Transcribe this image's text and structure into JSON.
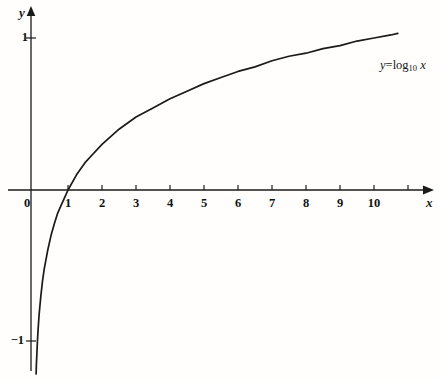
{
  "figure": {
    "background_color": "#fffefd",
    "ink_color": "#1a1a1a"
  },
  "axes": {
    "x_var_label": "x",
    "y_var_label": "y",
    "origin_label": "0"
  },
  "annotation": {
    "equation_y": "y",
    "equation_equals": "=",
    "equation_fn": "log",
    "equation_base": "10",
    "equation_arg": "x",
    "equation_plain": "y=log10 x"
  },
  "chart_data": {
    "type": "line",
    "title": "",
    "subtitle": "",
    "xlabel": "x",
    "ylabel": "y",
    "xlim": [
      -0.35,
      10.9
    ],
    "ylim": [
      -1.22,
      1.16
    ],
    "grid": false,
    "legend_position": "none",
    "annotations": [
      {
        "text": "y=log10 x",
        "x": 10.3,
        "y": 0.85
      }
    ],
    "xticks": [
      0,
      1,
      2,
      3,
      4,
      5,
      6,
      7,
      8,
      9,
      10
    ],
    "xtick_labels": [
      "0",
      "1",
      "2",
      "3",
      "4",
      "5",
      "6",
      "7",
      "8",
      "9",
      "10"
    ],
    "yticks": [
      -1,
      1
    ],
    "ytick_labels": [
      "-1",
      "1"
    ],
    "series": [
      {
        "name": "y=log10 x",
        "color": "#1a1a1a",
        "x": [
          0.062,
          0.07,
          0.08,
          0.09,
          0.1,
          0.12,
          0.15,
          0.2,
          0.25,
          0.3,
          0.4,
          0.5,
          0.6,
          0.7,
          0.8,
          0.9,
          1.0,
          1.25,
          1.5,
          1.75,
          2.0,
          2.5,
          3.0,
          3.5,
          4.0,
          4.5,
          5.0,
          5.5,
          6.0,
          6.5,
          7.0,
          7.5,
          8.0,
          8.5,
          9.0,
          9.5,
          10.0,
          10.5,
          10.7
        ],
        "y": [
          -1.21,
          -1.15,
          -1.1,
          -1.05,
          -1.0,
          -0.92,
          -0.82,
          -0.7,
          -0.6,
          -0.52,
          -0.4,
          -0.3,
          -0.22,
          -0.15,
          -0.1,
          -0.05,
          0.0,
          0.1,
          0.18,
          0.24,
          0.3,
          0.4,
          0.48,
          0.54,
          0.6,
          0.65,
          0.7,
          0.74,
          0.78,
          0.81,
          0.85,
          0.88,
          0.9,
          0.93,
          0.95,
          0.98,
          1.0,
          1.02,
          1.03
        ]
      }
    ]
  }
}
